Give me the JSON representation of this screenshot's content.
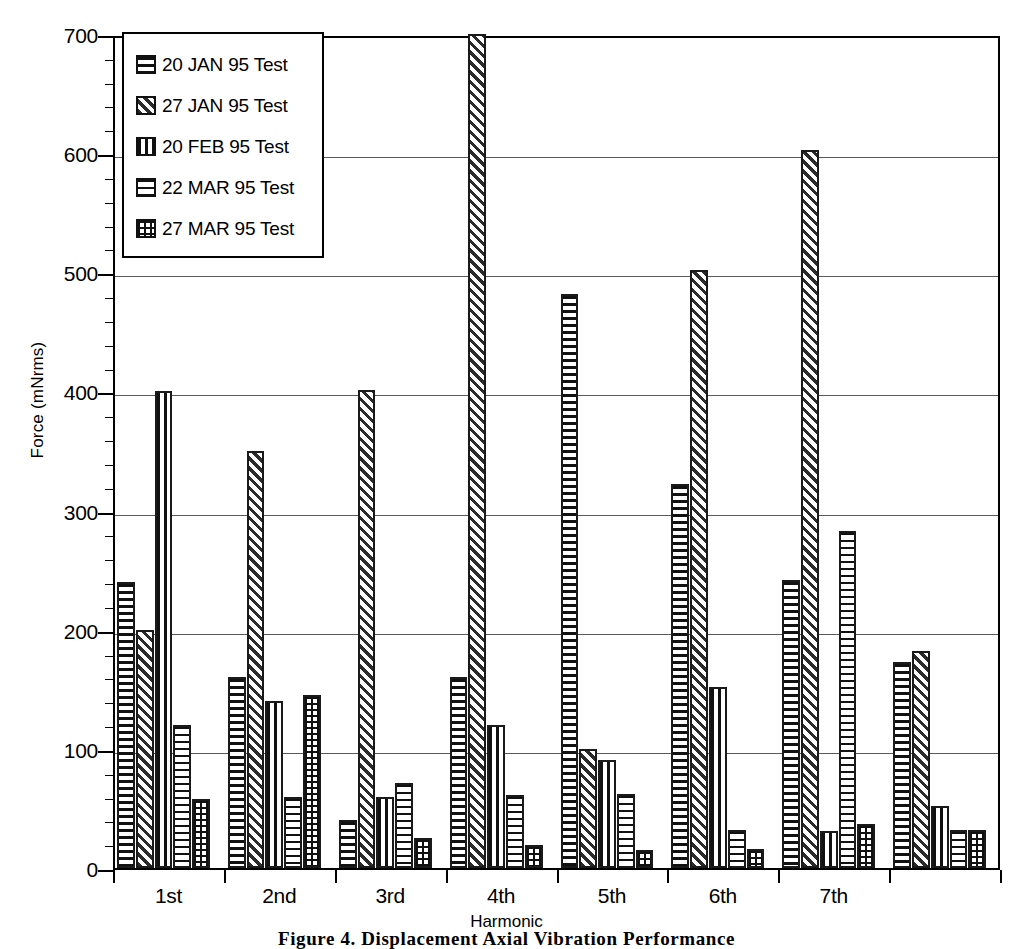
{
  "chart_data": {
    "type": "bar",
    "title": "",
    "xlabel": "Harmonic",
    "ylabel": "Force (mNrms)",
    "ylim": [
      0,
      700
    ],
    "ytick_labels": [
      "0",
      "100",
      "200",
      "300",
      "400",
      "500",
      "600",
      "700"
    ],
    "ytick_values": [
      0,
      100,
      200,
      300,
      400,
      500,
      600,
      700
    ],
    "grid": true,
    "legend_position": "upper-left",
    "categories": [
      "1st",
      "2nd",
      "3rd",
      "4th",
      "5th",
      "6th",
      "7th",
      ""
    ],
    "series": [
      {
        "name": "20 JAN 95 Test",
        "pattern": "horizontal-lines",
        "values": [
          240,
          160,
          40,
          160,
          482,
          322,
          242,
          173
        ]
      },
      {
        "name": "27 JAN 95 Test",
        "pattern": "diagonal-hatch",
        "values": [
          200,
          350,
          401,
          710,
          100,
          502,
          603,
          182
        ]
      },
      {
        "name": "20 FEB 95 Test",
        "pattern": "vertical-lines",
        "values": [
          400,
          140,
          60,
          120,
          91,
          152,
          31,
          52
        ]
      },
      {
        "name": "22 MAR 95 Test",
        "pattern": "horizontal-lines-coarse",
        "values": [
          120,
          60,
          71,
          61,
          62,
          32,
          283,
          32
        ]
      },
      {
        "name": "27 MAR 95 Test",
        "pattern": "cross-hatch",
        "values": [
          58,
          145,
          25,
          19,
          15,
          16,
          37,
          32
        ]
      }
    ]
  },
  "legend": {
    "items": [
      {
        "label": "20 JAN 95 Test",
        "pattern": "horizontal-lines"
      },
      {
        "label": "27 JAN 95 Test",
        "pattern": "diagonal-hatch"
      },
      {
        "label": "20 FEB 95 Test",
        "pattern": "vertical-lines"
      },
      {
        "label": "22 MAR 95 Test",
        "pattern": "horizontal-lines-coarse"
      },
      {
        "label": "27 MAR 95 Test",
        "pattern": "cross-hatch"
      }
    ]
  },
  "caption": "Figure 4.  Displacement Axial Vibration Performance",
  "colors": {
    "ink": "#000000",
    "gridline": "#5a5a5a",
    "background": "#ffffff"
  }
}
